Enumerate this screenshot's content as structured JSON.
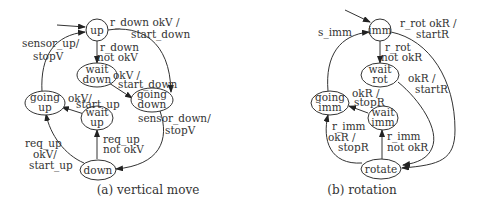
{
  "diagrams": [
    {
      "id": "a",
      "caption": "(a) vertical move",
      "nodes": {
        "up": {
          "line1": "up",
          "line2": ""
        },
        "wait_down": {
          "line1": "wait",
          "line2": "down"
        },
        "going_down": {
          "line1": "going",
          "line2": "down"
        },
        "going_up": {
          "line1": "going",
          "line2": "up"
        },
        "wait_up": {
          "line1": "wait",
          "line2": "up"
        },
        "down": {
          "line1": "down",
          "line2": ""
        }
      },
      "edges": {
        "up_to_going_down": {
          "line1": "r_down okV /",
          "line2": "start_down"
        },
        "up_to_wait_down": {
          "line1": "r_down",
          "line2": "not okV"
        },
        "wait_down_to_going_down": {
          "line1": "okV /",
          "line2": "start_down"
        },
        "going_up_to_up": {
          "line1": "sensor_up/",
          "line2": "stopV"
        },
        "wait_up_to_going_up": {
          "line1": "okV/",
          "line2": "start_up"
        },
        "going_down_to_down": {
          "line1": "sensor_down/",
          "line2": "stopV"
        },
        "down_to_going_up": {
          "line1": "req_up",
          "line2": "okV/",
          "line3": "start_up"
        },
        "down_to_wait_up": {
          "line1": "req_up",
          "line2": "not okV"
        }
      }
    },
    {
      "id": "b",
      "caption": "(b) rotation",
      "nodes": {
        "imm": {
          "line1": "imm",
          "line2": ""
        },
        "wait_rot": {
          "line1": "wait",
          "line2": "rot"
        },
        "going_imm": {
          "line1": "going",
          "line2": "imm"
        },
        "wait_imm": {
          "line1": "wait",
          "line2": "imm"
        },
        "rotate": {
          "line1": "rotate",
          "line2": ""
        }
      },
      "edges": {
        "going_imm_to_imm": {
          "line1": "s_imm"
        },
        "imm_to_rotate": {
          "line1": "r_rot  okR /",
          "line2": "startR"
        },
        "imm_to_wait_rot": {
          "line1": "r_rot",
          "line2": "not okR"
        },
        "wait_rot_to_rotate": {
          "line1": "okR /",
          "line2": "startR"
        },
        "wait_imm_to_going_imm": {
          "line1": "okR /",
          "line2": "stopR"
        },
        "rotate_to_going_imm": {
          "line1": "r_imm",
          "line2": "okR /",
          "line3": "stopR"
        },
        "rotate_to_wait_imm": {
          "line1": "r_imm",
          "line2": "not okR"
        }
      }
    }
  ]
}
